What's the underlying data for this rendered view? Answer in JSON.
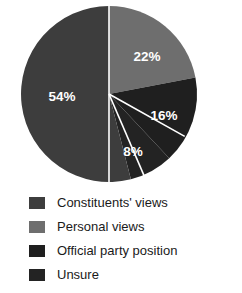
{
  "chart_data": {
    "type": "pie",
    "title": "",
    "categories": [
      "Constituents' views",
      "Personal views",
      "Official party position",
      "Unsure"
    ],
    "values": [
      54,
      22,
      16,
      8
    ],
    "labels": [
      "54%",
      "22%",
      "16%",
      "8%"
    ],
    "colors": [
      "#3d3d3d",
      "#6e6e6e",
      "#1f1f1f",
      "#232323"
    ],
    "start_angle_deg": 0,
    "direction": "clockwise",
    "slice_order": [
      "Personal views",
      "Official party position",
      "Unsure",
      "Constituents' views"
    ],
    "legend_position": "bottom",
    "label_color": "#ffffff",
    "separator_color": "#ffffff",
    "slices": [
      {
        "label": "22%",
        "value": 22,
        "category": "Personal views",
        "color": "#6e6e6e",
        "label_x": 147,
        "label_y": 57
      },
      {
        "label": "16%",
        "value": 16,
        "category": "Official party position",
        "color": "#1f1f1f",
        "label_x": 164,
        "label_y": 116
      },
      {
        "label": "8%",
        "value": 8,
        "category": "Unsure",
        "color": "#232323",
        "label_x": 133,
        "label_y": 152
      },
      {
        "label": "54%",
        "value": 54,
        "category": "Constituents' views",
        "color": "#3d3d3d",
        "label_x": 62,
        "label_y": 97
      }
    ]
  },
  "legend": {
    "items": [
      {
        "label": "Constituents' views",
        "color": "#3d3d3d"
      },
      {
        "label": "Personal views",
        "color": "#6e6e6e"
      },
      {
        "label": "Official party position",
        "color": "#1f1f1f"
      },
      {
        "label": "Unsure",
        "color": "#232323"
      }
    ]
  }
}
